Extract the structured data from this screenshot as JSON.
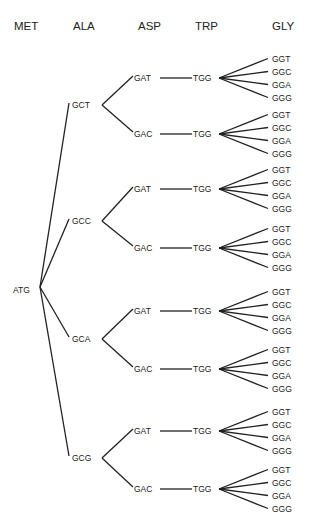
{
  "headers": [
    {
      "label": "MET",
      "x": 14
    },
    {
      "label": "ALA",
      "x": 73
    },
    {
      "label": "ASP",
      "x": 138
    },
    {
      "label": "TRP",
      "x": 195
    },
    {
      "label": "GLY",
      "x": 272
    }
  ],
  "root": {
    "codon": "ATG",
    "x": 13,
    "y": 290,
    "branch_x": 40,
    "branch_y": 287
  },
  "ala": [
    {
      "codon": "GCT",
      "y": 105
    },
    {
      "codon": "GCC",
      "y": 221
    },
    {
      "codon": "GCA",
      "y": 339
    },
    {
      "codon": "GCG",
      "y": 458
    }
  ],
  "asp_pairs": [
    [
      {
        "codon": "GAT",
        "y": 78
      },
      {
        "codon": "GAC",
        "y": 134
      }
    ],
    [
      {
        "codon": "GAT",
        "y": 189
      },
      {
        "codon": "GAC",
        "y": 248
      }
    ],
    [
      {
        "codon": "GAT",
        "y": 311
      },
      {
        "codon": "GAC",
        "y": 369
      }
    ],
    [
      {
        "codon": "GAT",
        "y": 431
      },
      {
        "codon": "GAC",
        "y": 489
      }
    ]
  ],
  "trp": {
    "codon": "TGG"
  },
  "gly": {
    "codons": [
      "GGT",
      "GGC",
      "GGA",
      "GGG"
    ],
    "spacing": 13
  },
  "colors": {
    "line": "#222222",
    "text": "#222222",
    "background": "#ffffff"
  }
}
